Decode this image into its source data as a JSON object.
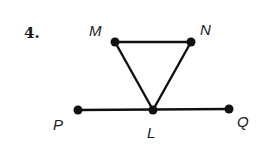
{
  "problem": {
    "number": "4."
  },
  "colors": {
    "ink": "#111111",
    "background": "#ffffff"
  },
  "points": [
    {
      "id": "M",
      "label": "M",
      "x": 115,
      "y": 42,
      "lx": 89,
      "ly": 36
    },
    {
      "id": "N",
      "label": "N",
      "x": 191,
      "y": 42,
      "lx": 200,
      "ly": 35
    },
    {
      "id": "P",
      "label": "P",
      "x": 78,
      "y": 110,
      "lx": 53,
      "ly": 130
    },
    {
      "id": "L",
      "label": "L",
      "x": 153,
      "y": 110,
      "lx": 147,
      "ly": 138
    },
    {
      "id": "Q",
      "label": "Q",
      "x": 229,
      "y": 109,
      "lx": 237,
      "ly": 127
    }
  ],
  "segments": [
    {
      "id": "MN",
      "from": "M",
      "to": "N"
    },
    {
      "id": "ML",
      "from": "M",
      "to": "L"
    },
    {
      "id": "NL",
      "from": "N",
      "to": "L"
    },
    {
      "id": "PQ",
      "from": "P",
      "to": "Q"
    }
  ]
}
